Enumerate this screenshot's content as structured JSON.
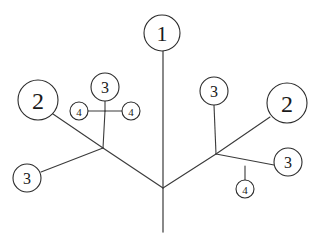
{
  "figure": {
    "background_color": "#ffffff",
    "line_color": "#3a3a3a",
    "trunk_color": "#6b6b6b",
    "node_fill": "#ffffff",
    "node_stroke": "#2b2b2b",
    "label_color": "#1a1a1a",
    "width": 320,
    "height": 242
  },
  "nodes": [
    {
      "id": "n1",
      "label": "1",
      "cx": 162,
      "cy": 33,
      "r": 18,
      "font_size": 22
    },
    {
      "id": "n2L",
      "label": "2",
      "cx": 38,
      "cy": 100,
      "r": 20,
      "font_size": 24
    },
    {
      "id": "n3T",
      "label": "3",
      "cx": 105,
      "cy": 87,
      "r": 14,
      "font_size": 16
    },
    {
      "id": "n4L",
      "label": "4",
      "cx": 79,
      "cy": 111,
      "r": 9,
      "font_size": 11
    },
    {
      "id": "n4R",
      "label": "4",
      "cx": 131,
      "cy": 111,
      "r": 9,
      "font_size": 11
    },
    {
      "id": "n3BL",
      "label": "3",
      "cx": 27,
      "cy": 178,
      "r": 14,
      "font_size": 16
    },
    {
      "id": "n3R",
      "label": "3",
      "cx": 214,
      "cy": 91,
      "r": 14,
      "font_size": 16
    },
    {
      "id": "n2R",
      "label": "2",
      "cx": 287,
      "cy": 103,
      "r": 20,
      "font_size": 24
    },
    {
      "id": "n3BR",
      "label": "3",
      "cx": 288,
      "cy": 162,
      "r": 14,
      "font_size": 16
    },
    {
      "id": "n4B",
      "label": "4",
      "cx": 245,
      "cy": 189,
      "r": 9,
      "font_size": 11
    }
  ],
  "junctions": [
    {
      "id": "jc",
      "name": "center-junction",
      "x": 163,
      "y": 188
    },
    {
      "id": "jl",
      "name": "left-junction",
      "x": 103,
      "y": 148
    },
    {
      "id": "jr",
      "name": "right-junction",
      "x": 216,
      "y": 154
    },
    {
      "id": "jt",
      "name": "four-tee",
      "x": 105,
      "y": 111
    },
    {
      "id": "jb",
      "name": "lower-right-tee",
      "x": 245,
      "y": 168
    }
  ],
  "edges": [
    {
      "id": "e-trunk-top",
      "name": "trunk-upper",
      "kind": "trunk",
      "x1": 163,
      "y1": 51,
      "x2": 163,
      "y2": 188
    },
    {
      "id": "e-trunk-bottom",
      "name": "trunk-lower",
      "kind": "trunk",
      "x1": 163,
      "y1": 188,
      "x2": 163,
      "y2": 232
    },
    {
      "id": "e-c-jl",
      "name": "center-to-left-junction",
      "kind": "edge",
      "x1": 163,
      "y1": 188,
      "x2": 103,
      "y2": 148
    },
    {
      "id": "e-c-jr",
      "name": "center-to-right-junction",
      "kind": "edge",
      "x1": 163,
      "y1": 188,
      "x2": 216,
      "y2": 154
    },
    {
      "id": "e-jl-2L",
      "name": "left-junction-to-two",
      "kind": "edge",
      "x1": 103,
      "y1": 148,
      "x2": 53,
      "y2": 114
    },
    {
      "id": "e-jl-3BL",
      "name": "left-junction-to-three",
      "kind": "edge",
      "x1": 103,
      "y1": 148,
      "x2": 41,
      "y2": 172
    },
    {
      "id": "e-jl-jt",
      "name": "left-junction-to-tee",
      "kind": "edge",
      "x1": 103,
      "y1": 148,
      "x2": 105,
      "y2": 111
    },
    {
      "id": "e-jt-3T",
      "name": "tee-to-three",
      "kind": "edge",
      "x1": 105,
      "y1": 111,
      "x2": 105,
      "y2": 101
    },
    {
      "id": "e-jt-4L",
      "name": "tee-to-left-four",
      "kind": "edge",
      "x1": 105,
      "y1": 111,
      "x2": 88,
      "y2": 111
    },
    {
      "id": "e-jt-4R",
      "name": "tee-to-right-four",
      "kind": "edge",
      "x1": 105,
      "y1": 111,
      "x2": 122,
      "y2": 111
    },
    {
      "id": "e-jr-3R",
      "name": "right-junction-to-three",
      "kind": "edge",
      "x1": 216,
      "y1": 154,
      "x2": 214,
      "y2": 105
    },
    {
      "id": "e-jr-2R",
      "name": "right-junction-to-two",
      "kind": "edge",
      "x1": 216,
      "y1": 154,
      "x2": 270,
      "y2": 117
    },
    {
      "id": "e-jr-jb",
      "name": "right-junction-to-tee",
      "kind": "edge",
      "x1": 216,
      "y1": 154,
      "x2": 274,
      "y2": 165
    },
    {
      "id": "e-jb-4B",
      "name": "tee-to-bottom-four",
      "kind": "edge",
      "x1": 245,
      "y1": 166,
      "x2": 245,
      "y2": 180
    }
  ]
}
